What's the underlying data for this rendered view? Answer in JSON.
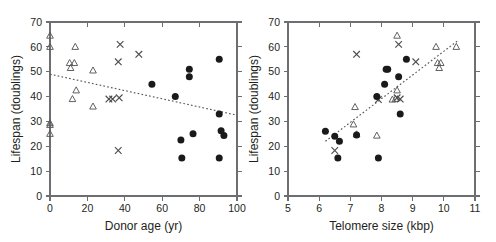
{
  "figure": {
    "background": "#ffffff",
    "panels": [
      "left",
      "right"
    ]
  },
  "chart_data": [
    {
      "id": "left",
      "type": "scatter",
      "title": "",
      "xlabel": "Donor age (yr)",
      "ylabel": "Lifespan (doublings)",
      "xlim": [
        0,
        100
      ],
      "ylim": [
        0,
        70
      ],
      "xticks": [
        0,
        20,
        40,
        60,
        80,
        100
      ],
      "yticks": [
        0,
        10,
        20,
        30,
        40,
        50,
        60,
        70
      ],
      "xtick_labels": [
        "0",
        "20",
        "40",
        "60",
        "80",
        "100"
      ],
      "ytick_labels": [
        "0",
        "10",
        "20",
        "30",
        "40",
        "50",
        "60",
        "70"
      ],
      "grid": false,
      "legend": "none",
      "trendline": {
        "style": "dotted",
        "x": [
          0,
          100
        ],
        "y": [
          49.0,
          32.5
        ]
      },
      "series": [
        {
          "name": "triangle",
          "marker": "open-triangle",
          "points": [
            [
              0.0,
              64.5
            ],
            [
              0.0,
              60.0
            ],
            [
              0.0,
              29.3
            ],
            [
              0.0,
              28.6
            ],
            [
              0.0,
              25.0
            ],
            [
              10.5,
              53.5
            ],
            [
              11.0,
              51.5
            ],
            [
              13.0,
              53.5
            ],
            [
              13.5,
              60.0
            ],
            [
              14.0,
              42.5
            ],
            [
              12.0,
              39.0
            ],
            [
              23.0,
              50.5
            ],
            [
              23.0,
              36.0
            ]
          ]
        },
        {
          "name": "cross",
          "marker": "x",
          "points": [
            [
              37.5,
              61.0
            ],
            [
              36.5,
              54.0
            ],
            [
              47.5,
              57.0
            ],
            [
              31.5,
              39.0
            ],
            [
              33.5,
              39.0
            ],
            [
              37.0,
              39.5
            ],
            [
              36.5,
              18.3
            ]
          ]
        },
        {
          "name": "circle",
          "marker": "filled-circle",
          "points": [
            [
              54.5,
              45.0
            ],
            [
              67.0,
              40.0
            ],
            [
              74.5,
              51.0
            ],
            [
              74.5,
              48.0
            ],
            [
              90.5,
              55.0
            ],
            [
              90.5,
              33.0
            ],
            [
              91.5,
              26.3
            ],
            [
              93.0,
              24.3
            ],
            [
              76.5,
              25.0
            ],
            [
              70.0,
              22.5
            ],
            [
              70.5,
              15.3
            ],
            [
              90.5,
              15.3
            ]
          ]
        }
      ]
    },
    {
      "id": "right",
      "type": "scatter",
      "title": "",
      "xlabel": "Telomere size (kbp)",
      "ylabel": "Lifespan (doublings)",
      "xlim": [
        5,
        11
      ],
      "ylim": [
        0,
        70
      ],
      "xticks": [
        5,
        6,
        7,
        8,
        9,
        10,
        11
      ],
      "yticks": [
        0,
        10,
        20,
        30,
        40,
        50,
        60,
        70
      ],
      "xtick_labels": [
        "5",
        "6",
        "7",
        "8",
        "9",
        "10",
        "11"
      ],
      "ytick_labels": [
        "0",
        "10",
        "20",
        "30",
        "40",
        "50",
        "60",
        "70"
      ],
      "grid": false,
      "legend": "none",
      "trendline": {
        "style": "dotted",
        "x": [
          6.2,
          10.45
        ],
        "y": [
          22.0,
          62.5
        ]
      },
      "series": [
        {
          "name": "triangle",
          "marker": "open-triangle",
          "points": [
            [
              8.5,
              64.5
            ],
            [
              9.75,
              60.0
            ],
            [
              10.4,
              60.0
            ],
            [
              9.8,
              53.5
            ],
            [
              9.9,
              53.5
            ],
            [
              9.85,
              51.5
            ],
            [
              8.5,
              42.5
            ],
            [
              8.45,
              39.0
            ],
            [
              8.35,
              38.8
            ],
            [
              7.15,
              35.8
            ],
            [
              7.1,
              28.8
            ],
            [
              7.2,
              24.8
            ],
            [
              7.85,
              24.3
            ]
          ]
        },
        {
          "name": "cross",
          "marker": "x",
          "points": [
            [
              8.55,
              61.0
            ],
            [
              7.2,
              57.0
            ],
            [
              9.1,
              54.0
            ],
            [
              8.5,
              39.5
            ],
            [
              8.6,
              39.0
            ],
            [
              7.9,
              38.8
            ],
            [
              6.5,
              18.3
            ]
          ]
        },
        {
          "name": "circle",
          "marker": "filled-circle",
          "points": [
            [
              8.8,
              55.0
            ],
            [
              8.2,
              51.0
            ],
            [
              8.15,
              51.0
            ],
            [
              8.55,
              48.0
            ],
            [
              8.1,
              45.0
            ],
            [
              7.85,
              40.0
            ],
            [
              8.6,
              33.0
            ],
            [
              6.2,
              26.0
            ],
            [
              6.5,
              24.0
            ],
            [
              6.65,
              22.0
            ],
            [
              7.2,
              24.5
            ],
            [
              6.6,
              15.3
            ],
            [
              7.9,
              15.3
            ]
          ]
        }
      ]
    }
  ]
}
